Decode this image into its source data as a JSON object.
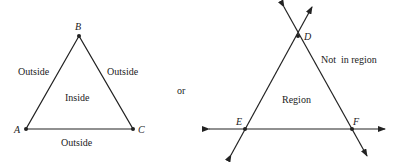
{
  "left_figure": {
    "points": {
      "A": "A",
      "B": "B",
      "C": "C"
    },
    "regions": {
      "inside": "Inside",
      "outside_left": "Outside",
      "outside_right": "Outside",
      "outside_bottom": "Outside"
    }
  },
  "connector": "or",
  "right_figure": {
    "points": {
      "D": "D",
      "E": "E",
      "F": "F"
    },
    "regions": {
      "region": "Region",
      "not_in_region": "Not  in region"
    }
  },
  "colors": {
    "stroke": "#222222",
    "background": "#ffffff"
  }
}
